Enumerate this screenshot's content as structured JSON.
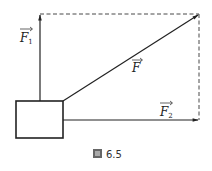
{
  "figure": {
    "caption_icon": "figure-icon",
    "caption_text": "6.5",
    "labels": {
      "f1": {
        "main": "F",
        "sub": "1"
      },
      "f": {
        "main": "F"
      },
      "f2": {
        "main": "F",
        "sub": "2"
      }
    },
    "colors": {
      "line": "#222222",
      "dashed": "#333333",
      "background": "#ffffff"
    }
  }
}
